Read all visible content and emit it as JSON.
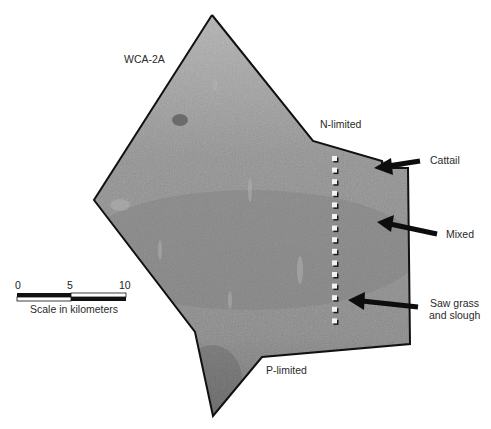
{
  "map": {
    "area_label": "WCA-2A",
    "gradient_labels": {
      "north": "N-limited",
      "south": "P-limited"
    },
    "vegetation_labels": [
      {
        "name": "cattail",
        "text": "Cattail"
      },
      {
        "name": "mixed",
        "text": "Mixed"
      },
      {
        "name": "sawgrass",
        "text": "Saw grass",
        "text2": "and slough"
      }
    ],
    "transect": {
      "sampling_site_count": 15
    },
    "scale_bar": {
      "ticks": [
        "0",
        "5",
        "10"
      ],
      "caption": "Scale in kilometers"
    },
    "colors": {
      "fill": "#8e8e8e",
      "outline": "#111111",
      "markers": "#f2f2f2",
      "arrows": "#0d0d0d"
    }
  }
}
